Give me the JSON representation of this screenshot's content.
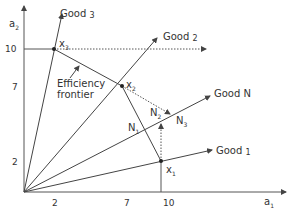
{
  "axes": {
    "x_label": "a",
    "x_sub": "1",
    "y_label": "a",
    "y_sub": "2"
  },
  "x_ticks": [
    "2",
    "7",
    "10"
  ],
  "y_ticks": [
    "10",
    "7",
    "2"
  ],
  "rays": {
    "good3": {
      "label": "Good",
      "num": "3"
    },
    "good2": {
      "label": "Good",
      "num": "2"
    },
    "goodN": {
      "label": "Good",
      "num": "N"
    },
    "good1": {
      "label": "Good",
      "num": "1"
    }
  },
  "points": {
    "x1": "x",
    "x1_sub": "1",
    "x2": "x",
    "x2_sub": "2",
    "x3": "x",
    "x3_sub": "3"
  },
  "n_points": {
    "n1": "N",
    "n1_sub": "1",
    "n2": "N",
    "n2_sub": "2",
    "n3": "N",
    "n3_sub": "3"
  },
  "frontier_label": {
    "line1": "Efficiency",
    "line2": "frontier"
  },
  "colors": {
    "line": "#444444"
  }
}
